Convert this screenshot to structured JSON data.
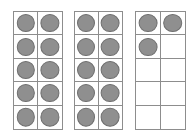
{
  "colors": {
    "background": "#ffffff",
    "frame_border": "#8d8d8d",
    "counter_fill": "#8f8f8f",
    "counter_border": "#6e6e6e"
  },
  "layout": {
    "columns": 2,
    "rows": 5,
    "cells_per_frame": 10
  },
  "total_counters": 23,
  "frames": [
    {
      "name": "ten-frame-1",
      "label": "Ten frame 1",
      "filled_count": 10,
      "x": 13,
      "y": 11,
      "width": 50,
      "height": 119,
      "cells": [
        {
          "row": 1,
          "col": 1,
          "filled": true
        },
        {
          "row": 1,
          "col": 2,
          "filled": true
        },
        {
          "row": 2,
          "col": 1,
          "filled": true
        },
        {
          "row": 2,
          "col": 2,
          "filled": true
        },
        {
          "row": 3,
          "col": 1,
          "filled": true
        },
        {
          "row": 3,
          "col": 2,
          "filled": true
        },
        {
          "row": 4,
          "col": 1,
          "filled": true
        },
        {
          "row": 4,
          "col": 2,
          "filled": true
        },
        {
          "row": 5,
          "col": 1,
          "filled": true
        },
        {
          "row": 5,
          "col": 2,
          "filled": true
        }
      ]
    },
    {
      "name": "ten-frame-2",
      "label": "Ten frame 2",
      "filled_count": 10,
      "x": 74,
      "y": 11,
      "width": 49,
      "height": 119,
      "cells": [
        {
          "row": 1,
          "col": 1,
          "filled": true
        },
        {
          "row": 1,
          "col": 2,
          "filled": true
        },
        {
          "row": 2,
          "col": 1,
          "filled": true
        },
        {
          "row": 2,
          "col": 2,
          "filled": true
        },
        {
          "row": 3,
          "col": 1,
          "filled": true
        },
        {
          "row": 3,
          "col": 2,
          "filled": true
        },
        {
          "row": 4,
          "col": 1,
          "filled": true
        },
        {
          "row": 4,
          "col": 2,
          "filled": true
        },
        {
          "row": 5,
          "col": 1,
          "filled": true
        },
        {
          "row": 5,
          "col": 2,
          "filled": true
        }
      ]
    },
    {
      "name": "ten-frame-3",
      "label": "Ten frame 3",
      "filled_count": 3,
      "x": 135,
      "y": 11,
      "width": 51,
      "height": 119,
      "cells": [
        {
          "row": 1,
          "col": 1,
          "filled": true
        },
        {
          "row": 1,
          "col": 2,
          "filled": true
        },
        {
          "row": 2,
          "col": 1,
          "filled": true
        },
        {
          "row": 2,
          "col": 2,
          "filled": false
        },
        {
          "row": 3,
          "col": 1,
          "filled": false
        },
        {
          "row": 3,
          "col": 2,
          "filled": false
        },
        {
          "row": 4,
          "col": 1,
          "filled": false
        },
        {
          "row": 4,
          "col": 2,
          "filled": false
        },
        {
          "row": 5,
          "col": 1,
          "filled": false
        },
        {
          "row": 5,
          "col": 2,
          "filled": false
        }
      ]
    }
  ]
}
